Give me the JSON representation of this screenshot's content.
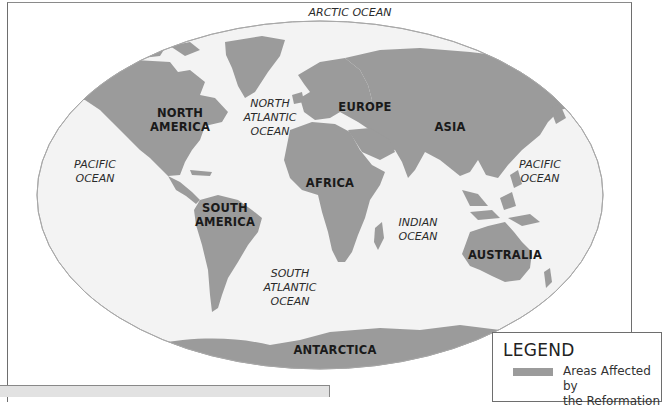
{
  "colors": {
    "land": "#9b9b9b",
    "ocean": "#f3f3f3",
    "ellipse_outline": "#a8a8a8",
    "frame": "#6e6e6e"
  },
  "continents": [
    {
      "id": "north-america",
      "label": "NORTH\nAMERICA"
    },
    {
      "id": "south-america",
      "label": "SOUTH\nAMERICA"
    },
    {
      "id": "europe",
      "label": "EUROPE"
    },
    {
      "id": "asia",
      "label": "ASIA"
    },
    {
      "id": "africa",
      "label": "AFRICA"
    },
    {
      "id": "australia",
      "label": "AUSTRALIA"
    },
    {
      "id": "antarctica",
      "label": "ANTARCTICA"
    }
  ],
  "oceans": [
    {
      "id": "arctic",
      "label": "ARCTIC OCEAN"
    },
    {
      "id": "north-atlantic",
      "label": "NORTH\nATLANTIC\nOCEAN"
    },
    {
      "id": "pacific-west",
      "label": "PACIFIC\nOCEAN"
    },
    {
      "id": "pacific-east",
      "label": "PACIFIC\nOCEAN"
    },
    {
      "id": "indian",
      "label": "INDIAN\nOCEAN"
    },
    {
      "id": "south-atlantic",
      "label": "SOUTH\nATLANTIC\nOCEAN"
    }
  ],
  "legend": {
    "title": "LEGEND",
    "items": [
      {
        "label": "Areas Affected by\nthe Reformation",
        "color": "#9b9b9b"
      }
    ]
  }
}
